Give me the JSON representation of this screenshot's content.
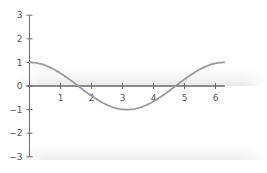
{
  "chart_data": {
    "type": "line",
    "title": "",
    "xlabel": "",
    "ylabel": "",
    "function": "cos(x)",
    "xlim": [
      0,
      6.28
    ],
    "ylim": [
      -3,
      3
    ],
    "grid": false,
    "legend": null,
    "x_ticks": [
      1,
      2,
      3,
      4,
      5,
      6
    ],
    "y_ticks": [
      3,
      2,
      1,
      0,
      -1,
      -2,
      -3
    ],
    "x_tick_labels": [
      "1",
      "2",
      "3",
      "4",
      "5",
      "6"
    ],
    "y_tick_labels": [
      "3",
      "2",
      "1",
      "0",
      "−1",
      "−2",
      "−3"
    ],
    "series": [
      {
        "name": "cos(x)",
        "color": "#9a9a9a",
        "x": [
          0,
          0.5,
          1,
          1.5,
          1.571,
          2,
          2.5,
          3,
          3.142,
          3.5,
          4,
          4.5,
          4.712,
          5,
          5.5,
          6,
          6.283
        ],
        "y": [
          1,
          0.878,
          0.54,
          0.071,
          0,
          -0.416,
          -0.801,
          -0.99,
          -1,
          -0.936,
          -0.654,
          -0.211,
          0,
          0.284,
          0.709,
          0.96,
          1
        ]
      }
    ]
  },
  "colors": {
    "axis": "#6a6a6a",
    "curve": "#9a9a9a",
    "band": "#ececec"
  }
}
